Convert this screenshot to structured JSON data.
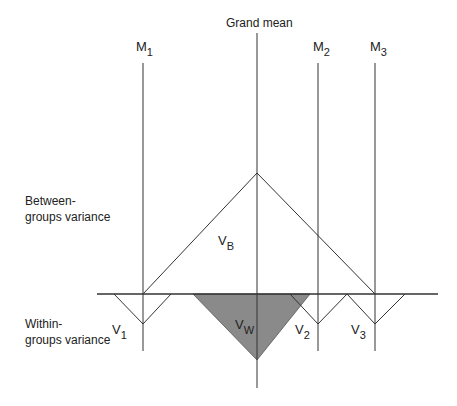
{
  "diagram": {
    "title_label": "Grand mean",
    "group_means": [
      {
        "label": "M",
        "sub": "1"
      },
      {
        "label": "M",
        "sub": "2"
      },
      {
        "label": "M",
        "sub": "3"
      }
    ],
    "row_labels": {
      "between_line1": "Between-",
      "between_line2": "groups variance",
      "within_line1": "Within-",
      "within_line2": "groups variance"
    },
    "variance_symbols": {
      "between": {
        "label": "V",
        "sub": "B"
      },
      "within": {
        "label": "V",
        "sub": "W"
      },
      "v1": {
        "label": "V",
        "sub": "1"
      },
      "v2": {
        "label": "V",
        "sub": "2"
      },
      "v3": {
        "label": "V",
        "sub": "3"
      }
    },
    "colors": {
      "line": "#333333",
      "shaded_triangle": "#8a8a8a"
    }
  }
}
